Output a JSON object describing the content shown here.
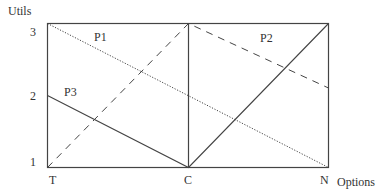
{
  "diagram": {
    "y_axis_label": "Utils",
    "x_axis_label": "Options",
    "y_ticks": [
      {
        "label": "3",
        "value": 3
      },
      {
        "label": "2",
        "value": 2
      },
      {
        "label": "1",
        "value": 1
      }
    ],
    "x_ticks": [
      {
        "label": "T"
      },
      {
        "label": "C"
      },
      {
        "label": "N"
      }
    ],
    "series": [
      {
        "name": "P1",
        "style": "dotted",
        "points": [
          {
            "x": "T",
            "y": 3
          },
          {
            "x": "N",
            "y": 1
          }
        ]
      },
      {
        "name": "P2",
        "style": "dashed",
        "points": [
          {
            "x": "T",
            "y": 1
          },
          {
            "x": "C",
            "y": 3
          },
          {
            "x": "N",
            "y": 2.1
          }
        ]
      },
      {
        "name": "P3",
        "style": "solid",
        "points": [
          {
            "x": "T",
            "y": 2
          },
          {
            "x": "C",
            "y": 1
          },
          {
            "x": "N",
            "y": 3
          }
        ]
      }
    ],
    "line_color": "#333333"
  }
}
